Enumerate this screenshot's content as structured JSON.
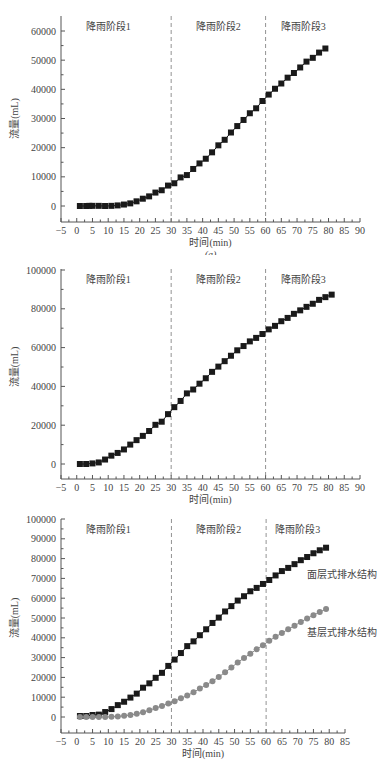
{
  "figure": {
    "panels": [
      "a",
      "b",
      "c"
    ]
  },
  "colors": {
    "series_black": "#1a1a1a",
    "series_gray": "#8a8a8a",
    "axis": "#555555",
    "divider": "#777777",
    "text": "#444444"
  },
  "chart_data": [
    {
      "type": "line",
      "panel_label": "(a)",
      "title": "",
      "xlabel": "时间(min)",
      "ylabel": "流量(mL)",
      "xlim": [
        -5,
        90
      ],
      "ylim": [
        -5000,
        65000
      ],
      "xticks": [
        -5,
        0,
        5,
        10,
        15,
        20,
        25,
        30,
        35,
        40,
        45,
        50,
        55,
        60,
        65,
        70,
        75,
        80,
        85,
        90
      ],
      "yticks": [
        0,
        10000,
        20000,
        30000,
        40000,
        50000,
        60000
      ],
      "grid": false,
      "vlines": [
        30,
        60
      ],
      "stage_labels": [
        {
          "text": "降雨阶段1",
          "x": 10
        },
        {
          "text": "降雨阶段2",
          "x": 45
        },
        {
          "text": "降雨阶段3",
          "x": 72
        }
      ],
      "series": [
        {
          "name": "流量",
          "marker": "square",
          "color": "#1a1a1a",
          "x": [
            1,
            3,
            4,
            5,
            7,
            9,
            11,
            13,
            15,
            17,
            19,
            21,
            23,
            25,
            27,
            29,
            31,
            33,
            35,
            37,
            39,
            41,
            43,
            45,
            47,
            49,
            51,
            53,
            55,
            57,
            59,
            61,
            63,
            65,
            67,
            69,
            71,
            73,
            75,
            77,
            79
          ],
          "values": [
            0,
            0,
            50,
            50,
            50,
            0,
            50,
            200,
            500,
            900,
            1600,
            2500,
            3300,
            4600,
            5400,
            7000,
            7800,
            9800,
            10600,
            12700,
            14600,
            16200,
            18400,
            20800,
            22700,
            25200,
            27400,
            29500,
            31800,
            33500,
            36000,
            38200,
            40200,
            42000,
            44000,
            45600,
            47500,
            49500,
            50800,
            52600,
            54000
          ]
        }
      ]
    },
    {
      "type": "line",
      "panel_label": "(b)",
      "title": "",
      "xlabel": "时间(min)",
      "ylabel": "流量(mL)",
      "xlim": [
        -5,
        90
      ],
      "ylim": [
        -5000,
        100000
      ],
      "xticks": [
        -5,
        0,
        5,
        10,
        15,
        20,
        25,
        30,
        35,
        40,
        45,
        50,
        55,
        60,
        65,
        70,
        75,
        80,
        85,
        90
      ],
      "yticks": [
        0,
        20000,
        40000,
        60000,
        80000,
        100000
      ],
      "grid": false,
      "vlines": [
        30,
        60
      ],
      "stage_labels": [
        {
          "text": "降雨阶段1",
          "x": 10
        },
        {
          "text": "降雨阶段2",
          "x": 45
        },
        {
          "text": "降雨阶段3",
          "x": 72
        }
      ],
      "series": [
        {
          "name": "流量",
          "marker": "square",
          "color": "#1a1a1a",
          "x": [
            1,
            3,
            5,
            7,
            9,
            11,
            13,
            15,
            17,
            19,
            21,
            23,
            25,
            27,
            29,
            31,
            33,
            35,
            37,
            39,
            41,
            43,
            45,
            47,
            49,
            51,
            53,
            55,
            57,
            59,
            61,
            63,
            65,
            67,
            69,
            71,
            73,
            75,
            77,
            79,
            81
          ],
          "values": [
            0,
            0,
            300,
            800,
            2300,
            4300,
            5700,
            7500,
            10000,
            12300,
            14500,
            17000,
            20200,
            21800,
            25700,
            29300,
            32500,
            36400,
            38400,
            41400,
            44200,
            47500,
            50200,
            53000,
            55800,
            58600,
            60800,
            63200,
            65000,
            67000,
            69400,
            71200,
            73600,
            75300,
            77400,
            79200,
            81000,
            82600,
            84600,
            86000,
            87300
          ]
        }
      ]
    },
    {
      "type": "line",
      "panel_label": "(c)",
      "title": "",
      "xlabel": "时间(min)",
      "ylabel": "流量(mL)",
      "xlim": [
        -5,
        85
      ],
      "ylim": [
        -5000,
        100000
      ],
      "xticks": [
        -5,
        0,
        5,
        10,
        15,
        20,
        25,
        30,
        35,
        40,
        45,
        50,
        55,
        60,
        65,
        70,
        75,
        80,
        85
      ],
      "yticks": [
        0,
        10000,
        20000,
        30000,
        40000,
        50000,
        60000,
        70000,
        80000,
        90000,
        100000
      ],
      "grid": false,
      "vlines": [
        30,
        60
      ],
      "stage_labels": [
        {
          "text": "降雨阶段1",
          "x": 10
        },
        {
          "text": "降雨阶段2",
          "x": 45
        },
        {
          "text": "降雨阶段3",
          "x": 70
        }
      ],
      "annotations": [
        {
          "text": "面层式排水结构",
          "x": 73,
          "y": 70000
        },
        {
          "text": "基层式排水结构",
          "x": 73,
          "y": 41000
        }
      ],
      "series": [
        {
          "name": "面层式排水结构",
          "marker": "square",
          "color": "#1a1a1a",
          "x": [
            1,
            3,
            5,
            7,
            9,
            11,
            13,
            15,
            17,
            19,
            21,
            23,
            25,
            27,
            29,
            31,
            33,
            35,
            37,
            39,
            41,
            43,
            45,
            47,
            49,
            51,
            53,
            55,
            57,
            59,
            61,
            63,
            65,
            67,
            69,
            71,
            73,
            75,
            77,
            79
          ],
          "values": [
            500,
            500,
            1000,
            1200,
            2500,
            4000,
            6000,
            7700,
            9800,
            11800,
            14800,
            17000,
            19800,
            22300,
            25800,
            29000,
            32300,
            35800,
            38200,
            41300,
            44300,
            47500,
            50200,
            53300,
            56000,
            58800,
            61000,
            63500,
            65200,
            67200,
            69200,
            71500,
            73700,
            75300,
            77200,
            79200,
            80800,
            82700,
            84200,
            85500
          ]
        },
        {
          "name": "基层式排水结构",
          "marker": "circle",
          "color": "#8a8a8a",
          "x": [
            1,
            3,
            5,
            7,
            9,
            11,
            13,
            15,
            17,
            19,
            21,
            23,
            25,
            27,
            29,
            31,
            33,
            35,
            37,
            39,
            41,
            43,
            45,
            47,
            49,
            51,
            53,
            55,
            57,
            59,
            61,
            63,
            65,
            67,
            69,
            71,
            73,
            75,
            77,
            79
          ],
          "values": [
            0,
            0,
            0,
            0,
            0,
            100,
            300,
            600,
            1000,
            1600,
            2400,
            3400,
            4500,
            5600,
            6800,
            7900,
            9500,
            10800,
            12500,
            14400,
            16200,
            18100,
            20200,
            22600,
            25000,
            27500,
            29800,
            32000,
            34200,
            36300,
            38500,
            40500,
            42400,
            44300,
            46100,
            48000,
            49800,
            51400,
            53000,
            54500
          ]
        }
      ]
    }
  ]
}
